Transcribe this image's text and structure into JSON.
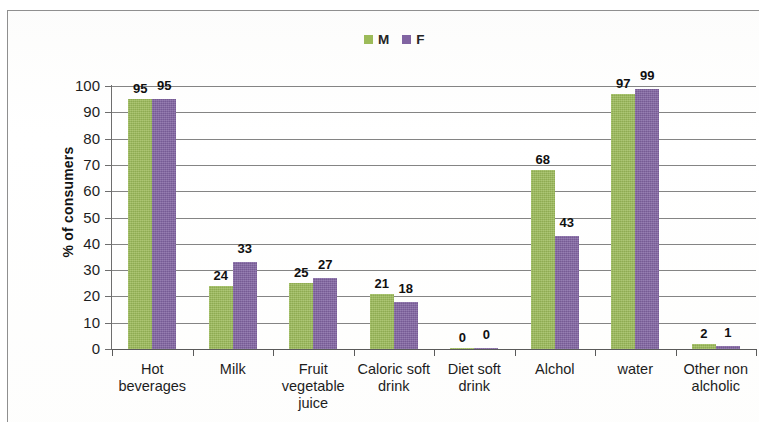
{
  "chart_data": {
    "type": "bar",
    "title": "",
    "xlabel": "",
    "ylabel": "% of consumers",
    "ylim": [
      0,
      100
    ],
    "ytick_step": 10,
    "yticks": [
      100,
      90,
      80,
      70,
      60,
      50,
      40,
      30,
      20,
      10,
      0
    ],
    "grid": true,
    "legend_position": "top-center",
    "categories": [
      "Hot beverages",
      "Milk",
      "Fruit vegetable juice",
      "Caloric soft drink",
      "Diet soft drink",
      "Alchol",
      "water",
      "Other non alcholic"
    ],
    "category_lines": [
      [
        "Hot",
        "beverages"
      ],
      [
        "Milk"
      ],
      [
        "Fruit",
        "vegetable",
        "juice"
      ],
      [
        "Caloric soft",
        "drink"
      ],
      [
        "Diet soft",
        "drink"
      ],
      [
        "Alchol"
      ],
      [
        "water"
      ],
      [
        "Other non",
        "alcholic"
      ]
    ],
    "series": [
      {
        "name": "M",
        "color": "#9cbb59",
        "values": [
          95,
          24,
          25,
          21,
          0,
          68,
          97,
          2
        ]
      },
      {
        "name": "F",
        "color": "#8164a2",
        "values": [
          95,
          33,
          27,
          18,
          0,
          43,
          99,
          1
        ]
      }
    ]
  },
  "legend": {
    "items": [
      {
        "label": "M",
        "color": "#9cbb59",
        "swatch_icon": "square-swatch-icon"
      },
      {
        "label": "F",
        "color": "#8164a2",
        "swatch_icon": "square-swatch-icon"
      }
    ]
  },
  "axes": {
    "y_title": "% of consumers"
  }
}
